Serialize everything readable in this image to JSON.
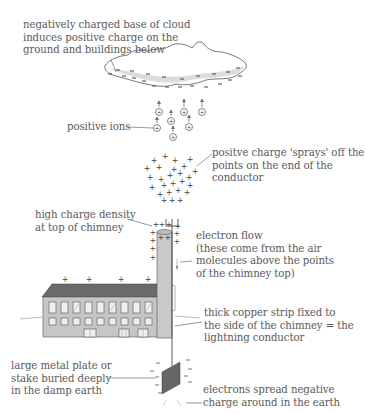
{
  "diagram": {
    "labels": {
      "cloud": "negatively charged base of cloud\ninduces positive charge on the\nground and buildings below",
      "ions": "positive ions",
      "spray": "positve charge 'sprays' off the\npoints on the end of the\nconductor",
      "density": "high charge density\nat top of chimney",
      "flow": "electron flow\n(these come from the air\nmolecules above the points\nof the chimney top)",
      "strip": "thick copper strip fixed to\nthe side of the chimney = the\nlightning conductor",
      "plate": "large metal plate or\nstake buried deeply\nin the damp earth",
      "spread": "electrons spread negative\ncharge around in the earth"
    },
    "symbols": {
      "positive": "+",
      "negative": "−"
    },
    "colors": {
      "text": "#5a5a5a",
      "line": "#555555",
      "cloud_shade": "#d8d8d8",
      "roof": "#6b6b6b",
      "wall": "#c6c6c6",
      "chimney": "#c9c9c9",
      "plate": "#666666"
    }
  }
}
